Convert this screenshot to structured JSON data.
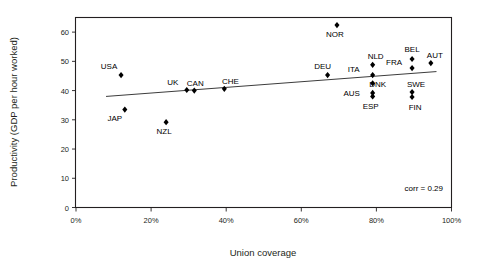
{
  "chart_data": {
    "type": "scatter",
    "title": "",
    "xlabel": "Union coverage",
    "ylabel": "Productivity (GDP per hour worked)",
    "xlim": [
      0,
      100
    ],
    "ylim": [
      0,
      65
    ],
    "xticks": [
      "0%",
      "20%",
      "40%",
      "60%",
      "80%",
      "100%"
    ],
    "xtick_values": [
      0,
      20,
      40,
      60,
      80,
      100
    ],
    "yticks": [
      "0",
      "10",
      "20",
      "30",
      "40",
      "50",
      "60"
    ],
    "ytick_values": [
      0,
      10,
      20,
      30,
      40,
      50,
      60
    ],
    "grid": false,
    "legend": "none",
    "annotation": "corr = 0.29",
    "correlation": 0.29,
    "trendline": {
      "x0": 8,
      "y0": 38.0,
      "x1": 96,
      "y1": 46.5
    },
    "points": [
      {
        "label": "USA",
        "x": 12,
        "y": 45.3,
        "label_dx": -12,
        "label_dy": -6
      },
      {
        "label": "JAP",
        "x": 13,
        "y": 33.5,
        "label_dx": -10,
        "label_dy": 11
      },
      {
        "label": "NZL",
        "x": 24,
        "y": 29.2,
        "label_dx": -2,
        "label_dy": 12
      },
      {
        "label": "UK",
        "x": 29.5,
        "y": 40.2,
        "label_dx": -14,
        "label_dy": -5
      },
      {
        "label": "CAN",
        "x": 31.5,
        "y": 40.0,
        "label_dx": 1,
        "label_dy": -5
      },
      {
        "label": "CHE",
        "x": 39.5,
        "y": 40.6,
        "label_dx": 6,
        "label_dy": -5
      },
      {
        "label": "DEU",
        "x": 67,
        "y": 45.3,
        "label_dx": -5,
        "label_dy": -6
      },
      {
        "label": "NOR",
        "x": 69.5,
        "y": 62.4,
        "label_dx": -2,
        "label_dy": 12
      },
      {
        "label": "NLD",
        "x": 79,
        "y": 48.8,
        "label_dx": 3,
        "label_dy": -6
      },
      {
        "label": "ITA",
        "x": 79,
        "y": 45.3,
        "label_dx": -19,
        "label_dy": -3
      },
      {
        "label": "DNK",
        "x": 79,
        "y": 42.5,
        "label_dx": 5,
        "label_dy": 4
      },
      {
        "label": "AUS",
        "x": 79,
        "y": 39.2,
        "label_dx": -21,
        "label_dy": 3
      },
      {
        "label": "ESP",
        "x": 79,
        "y": 38.0,
        "label_dx": -2,
        "label_dy": 13
      },
      {
        "label": "BEL",
        "x": 89.5,
        "y": 50.8,
        "label_dx": 0,
        "label_dy": -7
      },
      {
        "label": "FRA",
        "x": 89.5,
        "y": 47.7,
        "label_dx": -18,
        "label_dy": -3
      },
      {
        "label": "SWE",
        "x": 89.5,
        "y": 39.5,
        "label_dx": 4,
        "label_dy": -5
      },
      {
        "label": "FIN",
        "x": 89.5,
        "y": 37.8,
        "label_dx": 3,
        "label_dy": 13
      },
      {
        "label": "AUT",
        "x": 94.5,
        "y": 49.4,
        "label_dx": 4,
        "label_dy": -5
      }
    ],
    "colors": {
      "marker": "#000000",
      "frame": "#231f20",
      "trendline": "#3c3c3c",
      "text": "#231f20",
      "background": "#ffffff"
    }
  }
}
